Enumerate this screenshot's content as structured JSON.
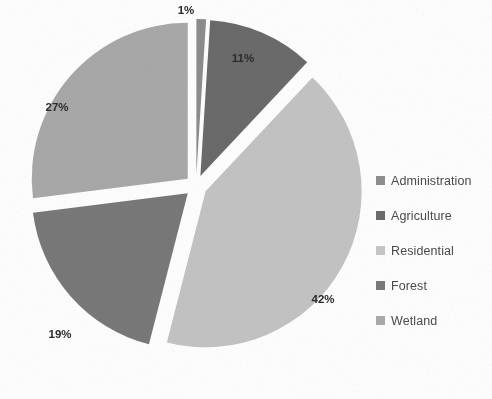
{
  "chart_data": {
    "type": "pie",
    "title": "",
    "subtitle": "",
    "xlabel": "",
    "ylabel": "",
    "exploded": true,
    "start_angle_deg": 0,
    "direction": "clockwise",
    "grid": false,
    "legend_position": "right",
    "value_suffix": "%",
    "categories": [
      "Administration",
      "Agriculture",
      "Residential",
      "Forest",
      "Wetland"
    ],
    "values": [
      1,
      11,
      42,
      19,
      27
    ],
    "labels": [
      "1%",
      "11%",
      "42%",
      "19%",
      "27%"
    ],
    "colors": [
      "#8d8d8d",
      "#6b6b6b",
      "#c4c4c4",
      "#797979",
      "#a9a9a9"
    ],
    "series": [
      {
        "name": "Land use",
        "values": [
          1,
          11,
          42,
          19,
          27
        ]
      }
    ],
    "slices": [
      {
        "name": "Administration",
        "value": 1,
        "label": "1%",
        "color": "#8d8d8d",
        "label_x": 186,
        "label_y": 11
      },
      {
        "name": "Agriculture",
        "value": 11,
        "label": "11%",
        "color": "#6b6b6b",
        "label_x": 243,
        "label_y": 59
      },
      {
        "name": "Residential",
        "value": 42,
        "label": "42%",
        "color": "#c4c4c4",
        "label_x": 323,
        "label_y": 300
      },
      {
        "name": "Forest",
        "value": 19,
        "label": "19%",
        "color": "#797979",
        "label_x": 60,
        "label_y": 335
      },
      {
        "name": "Wetland",
        "value": 27,
        "label": "27%",
        "color": "#a9a9a9",
        "label_x": 57,
        "label_y": 108
      }
    ]
  },
  "legend": {
    "items": [
      {
        "label": "Administration",
        "color": "#8d8d8d"
      },
      {
        "label": "Agriculture",
        "color": "#6b6b6b"
      },
      {
        "label": "Residential",
        "color": "#c4c4c4"
      },
      {
        "label": "Forest",
        "color": "#797979"
      },
      {
        "label": "Wetland",
        "color": "#a9a9a9"
      }
    ]
  },
  "geometry": {
    "center_x": 196,
    "center_y": 186,
    "radius": 156,
    "explode_offset": 11
  }
}
